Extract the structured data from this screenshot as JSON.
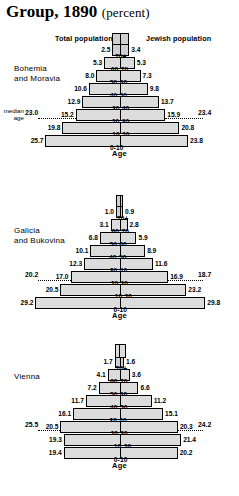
{
  "title": {
    "main": "Group, 1890",
    "paren": "(percent)"
  },
  "headers": {
    "left": "Total population",
    "right": "Jewish population"
  },
  "axis_label": "Age",
  "median_label_line1": "median",
  "median_label_line2": "age",
  "colors": {
    "bar_fill": "#dcdcdc",
    "bar_stroke": "#000000",
    "background": "#ffffff"
  },
  "chart_data": {
    "type": "bar",
    "title": "Group, 1890 (percent)",
    "xlabel": "",
    "ylabel": "Age",
    "subtype": "population-pyramid",
    "categories": [
      "70+",
      "60-70",
      "50-60",
      "40-50",
      "30-40",
      "20-30",
      "10-20",
      "0-10"
    ],
    "series_names": [
      "Total population",
      "Jewish population"
    ],
    "panels": [
      {
        "name": "Bohemia and Moravia",
        "region_line1": "Bohemia",
        "region_line2": "and Moravia",
        "median_age_left": "23.0",
        "median_age_right": "23.4",
        "rows": [
          {
            "age": "70+",
            "left": "2.5",
            "right": "3.4",
            "lv": 2.5,
            "rv": 3.4
          },
          {
            "age": "60-70",
            "left": "5.3",
            "right": "5.3",
            "lv": 5.3,
            "rv": 5.3
          },
          {
            "age": "50-60",
            "left": "8.0",
            "right": "7.3",
            "lv": 8.0,
            "rv": 7.3
          },
          {
            "age": "40-50",
            "left": "10.6",
            "right": "9.8",
            "lv": 10.6,
            "rv": 9.8
          },
          {
            "age": "30-40",
            "left": "12.9",
            "right": "13.7",
            "lv": 12.9,
            "rv": 13.7
          },
          {
            "age": "20-30",
            "left": "15.2",
            "right": "15.9",
            "lv": 15.2,
            "rv": 15.9
          },
          {
            "age": "10-20",
            "left": "19.8",
            "right": "20.8",
            "lv": 19.8,
            "rv": 20.8
          },
          {
            "age": "0-10",
            "left": "25.7",
            "right": "23.8",
            "lv": 25.7,
            "rv": 23.8
          }
        ]
      },
      {
        "name": "Galicia and Bukovina",
        "region_line1": "Galicia",
        "region_line2": "and Bukovina",
        "median_age_left": "20.2",
        "median_age_right": "18.7",
        "rows": [
          {
            "age": "70+",
            "left": "1.0",
            "right": "0.9",
            "lv": 1.0,
            "rv": 0.9
          },
          {
            "age": "60-70",
            "left": "3.1",
            "right": "2.8",
            "lv": 3.1,
            "rv": 2.8
          },
          {
            "age": "50-60",
            "left": "6.8",
            "right": "5.9",
            "lv": 6.8,
            "rv": 5.9
          },
          {
            "age": "40-50",
            "left": "10.1",
            "right": "8.9",
            "lv": 10.1,
            "rv": 8.9
          },
          {
            "age": "30-40",
            "left": "12.3",
            "right": "11.6",
            "lv": 12.3,
            "rv": 11.6
          },
          {
            "age": "20-30",
            "left": "17.0",
            "right": "16.9",
            "lv": 17.0,
            "rv": 16.9
          },
          {
            "age": "10-20",
            "left": "20.5",
            "right": "23.2",
            "lv": 20.5,
            "rv": 23.2
          },
          {
            "age": "0-10",
            "left": "29.2",
            "right": "29.8",
            "lv": 29.2,
            "rv": 29.8
          }
        ]
      },
      {
        "name": "Vienna",
        "region_line1": "Vienna",
        "region_line2": "",
        "median_age_left": "25.5",
        "median_age_right": "24.2",
        "rows": [
          {
            "age": "70+",
            "left": "1.7",
            "right": "1.6",
            "lv": 1.7,
            "rv": 1.6
          },
          {
            "age": "60-70",
            "left": "4.1",
            "right": "3.6",
            "lv": 4.1,
            "rv": 3.6
          },
          {
            "age": "50-60",
            "left": "7.2",
            "right": "6.6",
            "lv": 7.2,
            "rv": 6.6
          },
          {
            "age": "40-50",
            "left": "11.7",
            "right": "11.2",
            "lv": 11.7,
            "rv": 11.2
          },
          {
            "age": "30-40",
            "left": "16.1",
            "right": "15.1",
            "lv": 16.1,
            "rv": 15.1
          },
          {
            "age": "20-30",
            "left": "20.5",
            "right": "20.3",
            "lv": 20.5,
            "rv": 20.3
          },
          {
            "age": "10-20",
            "left": "19.3",
            "right": "21.4",
            "lv": 19.3,
            "rv": 21.4
          },
          {
            "age": "0-10",
            "left": "19.4",
            "right": "20.2",
            "lv": 19.4,
            "rv": 20.2
          }
        ]
      }
    ]
  }
}
